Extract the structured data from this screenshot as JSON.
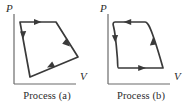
{
  "figure": {
    "title_visible": false,
    "background_color": "#ffffff",
    "stroke_color": "#3a3a3a",
    "axis_color": "#6b6b6b",
    "text_color": "#2b2b2b"
  },
  "panels": [
    {
      "id": "a",
      "caption": "Process (a)",
      "axes": {
        "y_label": "P",
        "x_label": "V",
        "origin": [
          14,
          84
        ],
        "y_top": [
          14,
          14
        ],
        "x_right": [
          74,
          84
        ]
      },
      "cycle": {
        "shape": "quadrilateral",
        "closed": true,
        "direction": "clockwise",
        "vertices": [
          {
            "name": "bottom-left",
            "x": 30,
            "y": 77
          },
          {
            "name": "top-left",
            "x": 20,
            "y": 22
          },
          {
            "name": "top-right",
            "x": 56,
            "y": 22
          },
          {
            "name": "right",
            "x": 78,
            "y": 57
          }
        ],
        "arrows": [
          {
            "edge": "left",
            "points": "up"
          },
          {
            "edge": "top",
            "points": "right"
          },
          {
            "edge": "upper-right",
            "points": "down-right"
          },
          {
            "edge": "lower-right",
            "points": "down-left"
          }
        ]
      }
    },
    {
      "id": "b",
      "caption": "Process (b)",
      "axes": {
        "y_label": "P",
        "x_label": "V",
        "origin": [
          14,
          84
        ],
        "y_top": [
          14,
          14
        ],
        "x_right": [
          74,
          84
        ]
      },
      "cycle": {
        "shape": "curved-parallelogram",
        "closed": true,
        "direction": "counterclockwise",
        "vertices": [
          {
            "name": "top-left",
            "x": 19,
            "y": 22
          },
          {
            "name": "top-right",
            "x": 51,
            "y": 22
          },
          {
            "name": "bottom-right",
            "x": 69,
            "y": 68
          },
          {
            "name": "bottom-left",
            "x": 24,
            "y": 68
          }
        ],
        "arrows": [
          {
            "edge": "top",
            "points": "left"
          },
          {
            "edge": "left-curve",
            "points": "down"
          },
          {
            "edge": "bottom",
            "points": "right"
          },
          {
            "edge": "right-curve",
            "points": "up"
          }
        ]
      }
    }
  ]
}
